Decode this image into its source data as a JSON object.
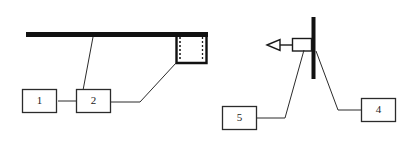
{
  "figure": {
    "type": "technical-line-diagram",
    "background_color": "#ffffff",
    "stroke_color": "#1a1a1a",
    "panels": [
      {
        "name": "left-panel",
        "description": "thick horizontal beam with downturned bracket box at right end",
        "callouts": [
          "1",
          "2"
        ]
      },
      {
        "name": "right-panel",
        "description": "vertical post with left-pointing arrow attached",
        "callouts": [
          "5",
          "4"
        ]
      }
    ]
  },
  "callouts": {
    "one": {
      "label": "1"
    },
    "two": {
      "label": "2"
    },
    "four": {
      "label": "4"
    },
    "five": {
      "label": "5"
    }
  },
  "geometry": {
    "beam": {
      "x1": 26,
      "y1": 34,
      "x2": 208,
      "y2": 34,
      "thickness": 5
    },
    "bracket_box": {
      "x": 176,
      "y": 36,
      "width": 30,
      "height": 27
    },
    "post": {
      "x": 313,
      "y1": 17,
      "y2": 79,
      "thickness": 4
    },
    "arrow": {
      "tip_x": 268,
      "tail_x": 312,
      "y": 45
    },
    "arrow_body_box": {
      "x": 292,
      "y": 39,
      "width": 18,
      "height": 12
    }
  },
  "colors": {
    "ink": "#1a1a1a",
    "paper": "#ffffff",
    "hairline": "#2b2b2b"
  }
}
